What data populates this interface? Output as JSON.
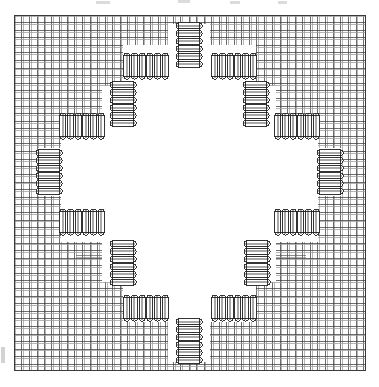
{
  "figure": {
    "kind": "technical-line-drawing",
    "caption": "",
    "width": 379,
    "height": 387
  },
  "canvas": {
    "background_color": "#ffffff",
    "ink_color": "#2b2b2b",
    "ink_color_light": "#8a8a8a",
    "ink_color_mid": "#5a5a5a",
    "coil_fill": "#ffffff",
    "coil_band_color": "#9a9a9a",
    "coil_outline_color": "#1e1e1e"
  },
  "plate": {
    "left": 14,
    "top": 15,
    "right": 366,
    "bottom": 371,
    "border_color": "#3a3a3a",
    "border_width": 1
  },
  "grid": {
    "description": "Fine orthogonal mesh of warp and weft yarns, each yarn drawn as a close pair of lines",
    "cell_size": 7.6,
    "pair_offset": 1.7,
    "line_width": 0.75,
    "dark_line_color": "#3c3c3c",
    "light_line_color": "#9c9c9c",
    "columns": 46,
    "rows": 47
  },
  "center_region": {
    "description": "Stretched open region where yarn spacing expands; only sparse yarn pairs cross",
    "x": 118,
    "y": 120,
    "width": 146,
    "height": 148,
    "fill": "#ffffff",
    "sparse_line_count": 6
  },
  "coils": {
    "description": "Bellows / helical-coil hinge elements forming a closed octagonal ring",
    "count": 16,
    "band_count": 6,
    "band_thickness": 2.2,
    "body_thickness": 21,
    "items": [
      {
        "id": "coil-n",
        "label": "north",
        "cx": 189,
        "cy": 45,
        "length": 46,
        "orientation": "vertical"
      },
      {
        "id": "coil-nne",
        "label": "north-north-east",
        "cx": 234,
        "cy": 66,
        "length": 46,
        "orientation": "horizontal"
      },
      {
        "id": "coil-ene",
        "label": "east-north-east",
        "cx": 256,
        "cy": 104,
        "length": 46,
        "orientation": "vertical"
      },
      {
        "id": "coil-ee",
        "label": "east-upper",
        "cx": 297,
        "cy": 126,
        "length": 46,
        "orientation": "horizontal"
      },
      {
        "id": "coil-e",
        "label": "east",
        "cx": 330,
        "cy": 172,
        "length": 46,
        "orientation": "vertical"
      },
      {
        "id": "coil-ese",
        "label": "east-south-east",
        "cx": 297,
        "cy": 222,
        "length": 46,
        "orientation": "horizontal"
      },
      {
        "id": "coil-sse",
        "label": "south-south-east",
        "cx": 257,
        "cy": 263,
        "length": 46,
        "orientation": "vertical"
      },
      {
        "id": "coil-sse2",
        "label": "south-east-lower",
        "cx": 234,
        "cy": 308,
        "length": 46,
        "orientation": "horizontal"
      },
      {
        "id": "coil-s",
        "label": "south",
        "cx": 189,
        "cy": 341,
        "length": 46,
        "orientation": "vertical"
      },
      {
        "id": "coil-ssw",
        "label": "south-south-west",
        "cx": 146,
        "cy": 308,
        "length": 46,
        "orientation": "horizontal"
      },
      {
        "id": "coil-wsw",
        "label": "west-south-west",
        "cx": 123,
        "cy": 263,
        "length": 46,
        "orientation": "vertical"
      },
      {
        "id": "coil-ws",
        "label": "west-lower",
        "cx": 82,
        "cy": 222,
        "length": 46,
        "orientation": "horizontal"
      },
      {
        "id": "coil-w",
        "label": "west",
        "cx": 49,
        "cy": 172,
        "length": 46,
        "orientation": "vertical"
      },
      {
        "id": "coil-wnw",
        "label": "west-north-west",
        "cx": 82,
        "cy": 126,
        "length": 46,
        "orientation": "horizontal"
      },
      {
        "id": "coil-nnw",
        "label": "north-north-west",
        "cx": 123,
        "cy": 104,
        "length": 46,
        "orientation": "vertical"
      },
      {
        "id": "coil-nw2",
        "label": "north-west-upper",
        "cx": 146,
        "cy": 66,
        "length": 46,
        "orientation": "horizontal"
      }
    ]
  },
  "ring_path": {
    "description": "Stepped octagonal outline connecting the coil ends",
    "points": [
      [
        168,
        24
      ],
      [
        210,
        24
      ],
      [
        210,
        45
      ],
      [
        256,
        45
      ],
      [
        256,
        86
      ],
      [
        276,
        86
      ],
      [
        276,
        126
      ],
      [
        318,
        126
      ],
      [
        318,
        148
      ],
      [
        342,
        148
      ],
      [
        342,
        196
      ],
      [
        318,
        196
      ],
      [
        318,
        242
      ],
      [
        276,
        242
      ],
      [
        276,
        282
      ],
      [
        256,
        282
      ],
      [
        256,
        322
      ],
      [
        210,
        322
      ],
      [
        210,
        362
      ],
      [
        168,
        362
      ],
      [
        168,
        322
      ],
      [
        123,
        322
      ],
      [
        123,
        282
      ],
      [
        102,
        282
      ],
      [
        102,
        242
      ],
      [
        61,
        242
      ],
      [
        61,
        196
      ],
      [
        38,
        196
      ],
      [
        38,
        148
      ],
      [
        61,
        148
      ],
      [
        61,
        126
      ],
      [
        102,
        126
      ],
      [
        102,
        86
      ],
      [
        123,
        86
      ],
      [
        123,
        45
      ],
      [
        168,
        45
      ]
    ]
  },
  "artifacts": {
    "description": "Scan artifacts retained from the original page",
    "top_smudges": [
      {
        "x": 96,
        "y": 1,
        "width": 14,
        "height": 3
      },
      {
        "x": 178,
        "y": 0,
        "width": 12,
        "height": 3
      },
      {
        "x": 230,
        "y": 1,
        "width": 10,
        "height": 3
      },
      {
        "x": 278,
        "y": 1,
        "width": 9,
        "height": 3
      }
    ],
    "left_mark": {
      "x": 1,
      "y": 347,
      "width": 4,
      "height": 16
    }
  },
  "chart_data": {
    "type": "diagram",
    "title": "",
    "xlabel": "",
    "ylabel": ""
  }
}
